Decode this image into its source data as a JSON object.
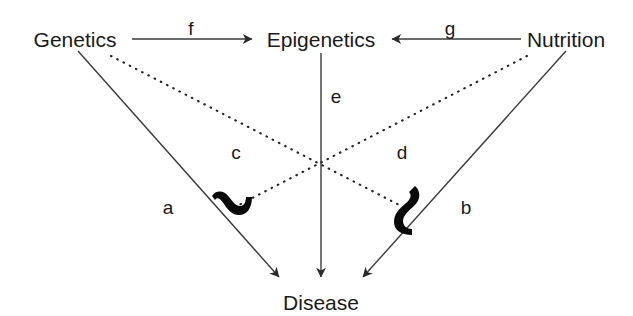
{
  "diagram": {
    "type": "causal-path-diagram",
    "title": "",
    "background_color": "#ffffff",
    "line_color": "#3a3a3a",
    "text_color": "#1a1a1a",
    "nodes": [
      {
        "id": "genetics",
        "label": "Genetics",
        "x": 75,
        "y": 40
      },
      {
        "id": "epigenetics",
        "label": "Epigenetics",
        "x": 321,
        "y": 40
      },
      {
        "id": "nutrition",
        "label": "Nutrition",
        "x": 566,
        "y": 40
      },
      {
        "id": "disease",
        "label": "Disease",
        "x": 321,
        "y": 303
      }
    ],
    "edges": [
      {
        "id": "a",
        "label": "a",
        "from": "genetics",
        "to": "disease",
        "style": "solid",
        "arrow": true,
        "label_x": 168,
        "label_y": 207
      },
      {
        "id": "b",
        "label": "b",
        "from": "nutrition",
        "to": "disease",
        "style": "solid",
        "arrow": true,
        "label_x": 466,
        "label_y": 207
      },
      {
        "id": "c",
        "label": "c",
        "from": "genetics",
        "to": "disease",
        "style": "dotted",
        "arrow": false,
        "label_x": 236,
        "label_y": 152
      },
      {
        "id": "d",
        "label": "d",
        "from": "nutrition",
        "to": "disease",
        "style": "dotted",
        "arrow": false,
        "label_x": 402,
        "label_y": 152
      },
      {
        "id": "e",
        "label": "e",
        "from": "epigenetics",
        "to": "disease",
        "style": "solid",
        "arrow": true,
        "label_x": 336,
        "label_y": 96
      },
      {
        "id": "f",
        "label": "f",
        "from": "genetics",
        "to": "epigenetics",
        "style": "solid",
        "arrow": true,
        "label_x": 191,
        "label_y": 28
      },
      {
        "id": "g",
        "label": "g",
        "from": "nutrition",
        "to": "epigenetics",
        "style": "solid",
        "arrow": true,
        "label_x": 450,
        "label_y": 28
      }
    ],
    "crossings": [
      {
        "id": "left-hop",
        "x": 228,
        "y": 206,
        "symbol": "line-hop-squiggle"
      },
      {
        "id": "right-hop",
        "x": 408,
        "y": 210,
        "symbol": "line-hop-squiggle"
      }
    ]
  }
}
